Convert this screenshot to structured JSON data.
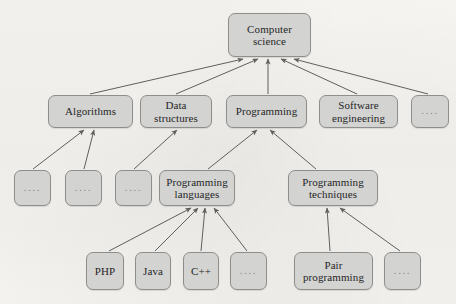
{
  "figure": {
    "kind": "hierarchy-tree-diagram",
    "background_color": "#f6f4f0",
    "node_fill_color": "#d3d3d2",
    "node_border_color": "#8e8e8c",
    "edge_color": "#5f5f5d",
    "text_color": "#262626"
  },
  "nodes": [
    {
      "id": "computer-science",
      "label": "Computer\nscience",
      "x": 228,
      "y": 13,
      "w": 83,
      "h": 44,
      "level": 1,
      "dots": false
    },
    {
      "id": "algorithms",
      "label": "Algorithms",
      "x": 48,
      "y": 95,
      "w": 85,
      "h": 33,
      "level": 2,
      "dots": false
    },
    {
      "id": "data-structures",
      "label": "Data\nstructures",
      "x": 140,
      "y": 95,
      "w": 72,
      "h": 33,
      "level": 2,
      "dots": false
    },
    {
      "id": "programming",
      "label": "Programming",
      "x": 226,
      "y": 95,
      "w": 81,
      "h": 33,
      "level": 2,
      "dots": false
    },
    {
      "id": "software-engineering",
      "label": "Software\nengineering",
      "x": 319,
      "y": 95,
      "w": 79,
      "h": 33,
      "level": 2,
      "dots": false
    },
    {
      "id": "cs-more",
      "label": "....",
      "x": 411,
      "y": 95,
      "w": 38,
      "h": 33,
      "level": 2,
      "dots": true
    },
    {
      "id": "algorithms-more-1",
      "label": "....",
      "x": 14,
      "y": 170,
      "w": 37,
      "h": 36,
      "level": 3,
      "dots": true
    },
    {
      "id": "algorithms-more-2",
      "label": "....",
      "x": 65,
      "y": 170,
      "w": 37,
      "h": 36,
      "level": 3,
      "dots": true
    },
    {
      "id": "data-structures-more",
      "label": "....",
      "x": 115,
      "y": 170,
      "w": 37,
      "h": 36,
      "level": 3,
      "dots": true
    },
    {
      "id": "programming-languages",
      "label": "Programming\nlanguages",
      "x": 159,
      "y": 170,
      "w": 76,
      "h": 36,
      "level": 3,
      "dots": false
    },
    {
      "id": "programming-techniques",
      "label": "Programming\ntechniques",
      "x": 288,
      "y": 170,
      "w": 90,
      "h": 36,
      "level": 3,
      "dots": false
    },
    {
      "id": "php",
      "label": "PHP",
      "x": 86,
      "y": 252,
      "w": 38,
      "h": 38,
      "level": 4,
      "dots": false
    },
    {
      "id": "java",
      "label": "Java",
      "x": 135,
      "y": 252,
      "w": 36,
      "h": 38,
      "level": 4,
      "dots": false
    },
    {
      "id": "cpp",
      "label": "C++",
      "x": 183,
      "y": 252,
      "w": 36,
      "h": 38,
      "level": 4,
      "dots": false
    },
    {
      "id": "languages-more",
      "label": "....",
      "x": 230,
      "y": 252,
      "w": 37,
      "h": 38,
      "level": 4,
      "dots": true
    },
    {
      "id": "pair-programming",
      "label": "Pair\nprogramming",
      "x": 294,
      "y": 252,
      "w": 79,
      "h": 38,
      "level": 4,
      "dots": false
    },
    {
      "id": "techniques-more",
      "label": "....",
      "x": 384,
      "y": 252,
      "w": 37,
      "h": 38,
      "level": 4,
      "dots": true
    }
  ],
  "edges": [
    {
      "from": "algorithms",
      "to": "computer-science",
      "x1": 90,
      "y1": 94,
      "x2": 243,
      "y2": 59
    },
    {
      "from": "data-structures",
      "to": "computer-science",
      "x1": 176,
      "y1": 94,
      "x2": 258,
      "y2": 59
    },
    {
      "from": "programming",
      "to": "computer-science",
      "x1": 268,
      "y1": 94,
      "x2": 268,
      "y2": 59
    },
    {
      "from": "software-engineering",
      "to": "computer-science",
      "x1": 357,
      "y1": 94,
      "x2": 281,
      "y2": 59
    },
    {
      "from": "cs-more",
      "to": "computer-science",
      "x1": 428,
      "y1": 94,
      "x2": 294,
      "y2": 59
    },
    {
      "from": "algorithms-more-1",
      "to": "algorithms",
      "x1": 33,
      "y1": 169,
      "x2": 84,
      "y2": 130
    },
    {
      "from": "algorithms-more-2",
      "to": "algorithms",
      "x1": 84,
      "y1": 169,
      "x2": 94,
      "y2": 130
    },
    {
      "from": "data-structures-more",
      "to": "data-structures",
      "x1": 134,
      "y1": 169,
      "x2": 177,
      "y2": 130
    },
    {
      "from": "programming-languages",
      "to": "programming",
      "x1": 208,
      "y1": 169,
      "x2": 257,
      "y2": 130
    },
    {
      "from": "programming-techniques",
      "to": "programming",
      "x1": 316,
      "y1": 169,
      "x2": 270,
      "y2": 130
    },
    {
      "from": "php",
      "to": "programming-languages",
      "x1": 109,
      "y1": 251,
      "x2": 191,
      "y2": 208
    },
    {
      "from": "java",
      "to": "programming-languages",
      "x1": 155,
      "y1": 251,
      "x2": 198,
      "y2": 208
    },
    {
      "from": "cpp",
      "to": "programming-languages",
      "x1": 201,
      "y1": 251,
      "x2": 205,
      "y2": 208
    },
    {
      "from": "languages-more",
      "to": "programming-languages",
      "x1": 247,
      "y1": 251,
      "x2": 214,
      "y2": 208
    },
    {
      "from": "pair-programming",
      "to": "programming-techniques",
      "x1": 330,
      "y1": 251,
      "x2": 327,
      "y2": 208
    },
    {
      "from": "techniques-more",
      "to": "programming-techniques",
      "x1": 400,
      "y1": 251,
      "x2": 340,
      "y2": 208
    }
  ]
}
